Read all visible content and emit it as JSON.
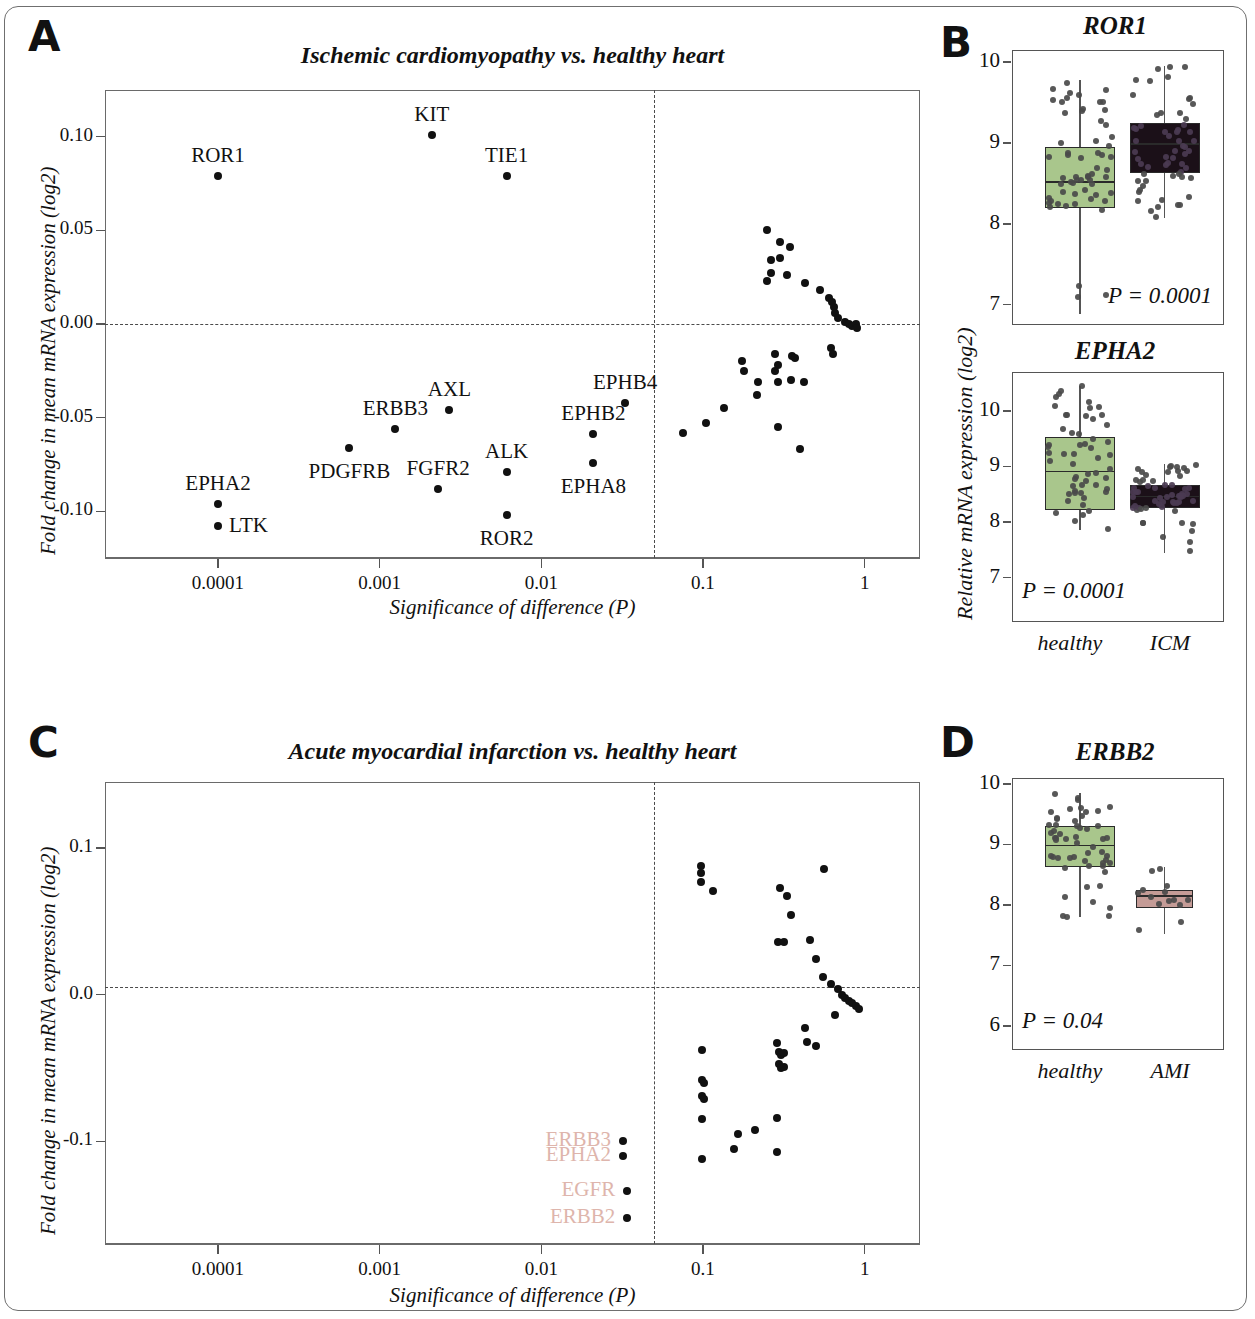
{
  "figure": {
    "panels": [
      "A",
      "B",
      "C",
      "D"
    ]
  },
  "panelA": {
    "letter": "A",
    "title": "Ischemic cardiomyopathy vs. healthy heart",
    "ylabel": "Fold change in mean mRNA expression (log2)",
    "xlabel": "Significance of difference (P)",
    "yticks": [
      "0.10",
      "0.05",
      "0.00",
      "-0.05",
      "-0.10"
    ],
    "xticks": [
      "0.0001",
      "0.001",
      "0.01",
      "0.1",
      "1"
    ]
  },
  "panelB": {
    "letter": "B",
    "ylabel": "Relative mRNA expression (log2)",
    "charts": [
      {
        "title": "ROR1",
        "yticks": [
          "10",
          "9",
          "8",
          "7"
        ],
        "pvalue": "P = 0.0001",
        "groups": [
          "healthy",
          "ICM"
        ]
      },
      {
        "title": "EPHA2",
        "yticks": [
          "10",
          "9",
          "8",
          "7"
        ],
        "pvalue": "P = 0.0001",
        "groups": [
          "healthy",
          "ICM"
        ]
      }
    ],
    "group_labels": [
      "healthy",
      "ICM"
    ]
  },
  "panelC": {
    "letter": "C",
    "title": "Acute myocardial infarction vs. healthy heart",
    "ylabel": "Fold change in mean mRNA expression (log2)",
    "xlabel": "Significance of difference (P)",
    "yticks": [
      "0.1",
      "0.0",
      "-0.1"
    ],
    "xticks": [
      "0.0001",
      "0.001",
      "0.01",
      "0.1",
      "1"
    ]
  },
  "panelD": {
    "letter": "D",
    "chart": {
      "title": "ERBB2",
      "yticks": [
        "10",
        "9",
        "8",
        "7",
        "6"
      ],
      "pvalue": "P = 0.04",
      "groups": [
        "healthy",
        "AMI"
      ]
    }
  },
  "colors": {
    "healthy_box": "#a9c68c",
    "icm_box": "#1b1018",
    "ami_box": "#c49b96",
    "pink_label": "#deb5ac",
    "dot": "#111111",
    "frame": "#6a6a6a"
  },
  "chart_data": [
    {
      "id": "panel-a",
      "type": "scatter",
      "title": "Ischemic cardiomyopathy vs. healthy heart",
      "xlabel": "Significance of difference (P)",
      "ylabel": "Fold change in mean mRNA expression (log2)",
      "xscale": "log",
      "xlim": [
        2e-05,
        2.2
      ],
      "ylim": [
        -0.125,
        0.125
      ],
      "xticks": [
        0.0001,
        0.001,
        0.01,
        0.1,
        1
      ],
      "yticks": [
        0.1,
        0.05,
        0.0,
        -0.05,
        -0.1
      ],
      "grid": false,
      "legend": "none",
      "annotations": {
        "vertical_dashed_line_at_p": 0.05,
        "horizontal_dashed_line_at_y": 0.0
      },
      "labeled_points": [
        {
          "label": "ROR1",
          "p": 0.0001,
          "fold": 0.079,
          "label_pos": "above"
        },
        {
          "label": "KIT",
          "p": 0.0021,
          "fold": 0.101,
          "label_pos": "above"
        },
        {
          "label": "TIE1",
          "p": 0.0061,
          "fold": 0.079,
          "label_pos": "above"
        },
        {
          "label": "EPHA2",
          "p": 0.0001,
          "fold": -0.096,
          "label_pos": "above"
        },
        {
          "label": "LTK",
          "p": 0.0001,
          "fold": -0.108,
          "label_pos": "right"
        },
        {
          "label": "PDGFRB",
          "p": 0.00065,
          "fold": -0.066,
          "label_pos": "below"
        },
        {
          "label": "ERBB3",
          "p": 0.00125,
          "fold": -0.056,
          "label_pos": "above"
        },
        {
          "label": "AXL",
          "p": 0.0027,
          "fold": -0.046,
          "label_pos": "above"
        },
        {
          "label": "FGFR2",
          "p": 0.0023,
          "fold": -0.088,
          "label_pos": "above"
        },
        {
          "label": "ALK",
          "p": 0.0061,
          "fold": -0.079,
          "label_pos": "above"
        },
        {
          "label": "ROR2",
          "p": 0.0061,
          "fold": -0.102,
          "label_pos": "below"
        },
        {
          "label": "EPHB2",
          "p": 0.021,
          "fold": -0.059,
          "label_pos": "above"
        },
        {
          "label": "EPHA8",
          "p": 0.021,
          "fold": -0.074,
          "label_pos": "below"
        },
        {
          "label": "EPHB4",
          "p": 0.033,
          "fold": -0.042,
          "label_pos": "above"
        }
      ],
      "unlabeled_points": [
        {
          "p": 0.25,
          "fold": 0.05
        },
        {
          "p": 0.3,
          "fold": 0.044
        },
        {
          "p": 0.345,
          "fold": 0.041
        },
        {
          "p": 0.265,
          "fold": 0.034
        },
        {
          "p": 0.3,
          "fold": 0.035
        },
        {
          "p": 0.265,
          "fold": 0.027
        },
        {
          "p": 0.25,
          "fold": 0.023
        },
        {
          "p": 0.33,
          "fold": 0.026
        },
        {
          "p": 0.43,
          "fold": 0.022
        },
        {
          "p": 0.53,
          "fold": 0.018
        },
        {
          "p": 0.6,
          "fold": 0.014
        },
        {
          "p": 0.63,
          "fold": 0.012
        },
        {
          "p": 0.65,
          "fold": 0.009
        },
        {
          "p": 0.66,
          "fold": 0.006
        },
        {
          "p": 0.68,
          "fold": 0.003
        },
        {
          "p": 0.76,
          "fold": 0.001
        },
        {
          "p": 0.8,
          "fold": 0.0
        },
        {
          "p": 0.84,
          "fold": -0.001
        },
        {
          "p": 0.88,
          "fold": 0.0
        },
        {
          "p": 0.9,
          "fold": -0.002
        },
        {
          "p": 0.62,
          "fold": -0.013
        },
        {
          "p": 0.64,
          "fold": -0.016
        },
        {
          "p": 0.28,
          "fold": -0.016
        },
        {
          "p": 0.29,
          "fold": -0.022
        },
        {
          "p": 0.355,
          "fold": -0.017
        },
        {
          "p": 0.37,
          "fold": -0.018
        },
        {
          "p": 0.28,
          "fold": -0.025
        },
        {
          "p": 0.175,
          "fold": -0.02
        },
        {
          "p": 0.18,
          "fold": -0.025
        },
        {
          "p": 0.22,
          "fold": -0.031
        },
        {
          "p": 0.29,
          "fold": -0.031
        },
        {
          "p": 0.35,
          "fold": -0.03
        },
        {
          "p": 0.42,
          "fold": -0.031
        },
        {
          "p": 0.215,
          "fold": -0.038
        },
        {
          "p": 0.29,
          "fold": -0.055
        },
        {
          "p": 0.135,
          "fold": -0.045
        },
        {
          "p": 0.105,
          "fold": -0.053
        },
        {
          "p": 0.075,
          "fold": -0.058
        },
        {
          "p": 0.4,
          "fold": -0.067
        }
      ]
    },
    {
      "id": "panel-c",
      "type": "scatter",
      "title": "Acute myocardial infarction vs. healthy heart",
      "xlabel": "Significance of difference (P)",
      "ylabel": "Fold change in mean mRNA expression (log2)",
      "xscale": "log",
      "xlim": [
        2e-05,
        2.2
      ],
      "ylim": [
        -0.17,
        0.145
      ],
      "xticks": [
        0.0001,
        0.001,
        0.01,
        0.1,
        1
      ],
      "yticks": [
        0.1,
        0.0,
        -0.1
      ],
      "grid": false,
      "legend": "none",
      "annotations": {
        "vertical_dashed_line_at_p": 0.05,
        "horizontal_dashed_line_at_y": 0.005
      },
      "labeled_points": [
        {
          "label": "ERBB3",
          "p": 0.032,
          "fold": -0.1,
          "label_pos": "left"
        },
        {
          "label": "EPHA2",
          "p": 0.032,
          "fold": -0.11,
          "label_pos": "left"
        },
        {
          "label": "EGFR",
          "p": 0.034,
          "fold": -0.134,
          "label_pos": "left"
        },
        {
          "label": "ERBB2",
          "p": 0.034,
          "fold": -0.152,
          "label_pos": "left"
        }
      ],
      "unlabeled_points": [
        {
          "p": 0.097,
          "fold": 0.088
        },
        {
          "p": 0.097,
          "fold": 0.083
        },
        {
          "p": 0.097,
          "fold": 0.077
        },
        {
          "p": 0.115,
          "fold": 0.071
        },
        {
          "p": 0.3,
          "fold": 0.073
        },
        {
          "p": 0.33,
          "fold": 0.067
        },
        {
          "p": 0.56,
          "fold": 0.086
        },
        {
          "p": 0.35,
          "fold": 0.054
        },
        {
          "p": 0.29,
          "fold": 0.036
        },
        {
          "p": 0.315,
          "fold": 0.036
        },
        {
          "p": 0.46,
          "fold": 0.037
        },
        {
          "p": 0.5,
          "fold": 0.024
        },
        {
          "p": 0.55,
          "fold": 0.012
        },
        {
          "p": 0.62,
          "fold": 0.007
        },
        {
          "p": 0.68,
          "fold": 0.004
        },
        {
          "p": 0.72,
          "fold": 0.0
        },
        {
          "p": 0.76,
          "fold": -0.002
        },
        {
          "p": 0.8,
          "fold": -0.004
        },
        {
          "p": 0.84,
          "fold": -0.006
        },
        {
          "p": 0.88,
          "fold": -0.008
        },
        {
          "p": 0.92,
          "fold": -0.01
        },
        {
          "p": 0.66,
          "fold": -0.014
        },
        {
          "p": 0.43,
          "fold": -0.023
        },
        {
          "p": 0.44,
          "fold": -0.032
        },
        {
          "p": 0.5,
          "fold": -0.035
        },
        {
          "p": 0.285,
          "fold": -0.033
        },
        {
          "p": 0.295,
          "fold": -0.039
        },
        {
          "p": 0.305,
          "fold": -0.041
        },
        {
          "p": 0.315,
          "fold": -0.04
        },
        {
          "p": 0.295,
          "fold": -0.047
        },
        {
          "p": 0.305,
          "fold": -0.05
        },
        {
          "p": 0.318,
          "fold": -0.049
        },
        {
          "p": 0.098,
          "fold": -0.038
        },
        {
          "p": 0.098,
          "fold": -0.058
        },
        {
          "p": 0.101,
          "fold": -0.06
        },
        {
          "p": 0.098,
          "fold": -0.069
        },
        {
          "p": 0.101,
          "fold": -0.071
        },
        {
          "p": 0.098,
          "fold": -0.085
        },
        {
          "p": 0.098,
          "fold": -0.112
        },
        {
          "p": 0.165,
          "fold": -0.095
        },
        {
          "p": 0.21,
          "fold": -0.092
        },
        {
          "p": 0.285,
          "fold": -0.084
        },
        {
          "p": 0.155,
          "fold": -0.105
        },
        {
          "p": 0.285,
          "fold": -0.107
        }
      ]
    },
    {
      "id": "panel-b-ror1",
      "type": "boxplot",
      "title": "ROR1",
      "ylabel": "Relative mRNA expression (log2)",
      "ylim": [
        6.75,
        10.15
      ],
      "yticks": [
        10,
        9,
        8,
        7
      ],
      "pvalue": "P = 0.0001",
      "boxes": [
        {
          "group": "healthy",
          "q1": 8.2,
          "median": 8.52,
          "q3": 8.95,
          "whisker_low": 6.88,
          "whisker_high": 9.78,
          "fill": "#a9c68c",
          "n": 60
        },
        {
          "group": "ICM",
          "q1": 8.63,
          "median": 8.99,
          "q3": 9.25,
          "whisker_low": 8.07,
          "whisker_high": 9.95,
          "fill": "#1b1018",
          "n": 60
        }
      ]
    },
    {
      "id": "panel-b-epha2",
      "type": "boxplot",
      "title": "EPHA2",
      "ylabel": "Relative mRNA expression (log2)",
      "ylim": [
        6.2,
        10.7
      ],
      "yticks": [
        10,
        9,
        8,
        7
      ],
      "pvalue": "P = 0.0001",
      "boxes": [
        {
          "group": "healthy",
          "q1": 8.22,
          "median": 8.91,
          "q3": 9.53,
          "whisker_low": 7.85,
          "whisker_high": 10.45,
          "fill": "#a9c68c",
          "n": 55
        },
        {
          "group": "ICM",
          "q1": 8.25,
          "median": 8.46,
          "q3": 8.67,
          "whisker_low": 7.45,
          "whisker_high": 9.05,
          "fill": "#1b1018",
          "n": 60
        }
      ]
    },
    {
      "id": "panel-d-erbb2",
      "type": "boxplot",
      "title": "ERBB2",
      "ylabel": "",
      "ylim": [
        5.6,
        10.1
      ],
      "yticks": [
        10,
        9,
        8,
        7,
        6
      ],
      "pvalue": "P = 0.04",
      "boxes": [
        {
          "group": "healthy",
          "q1": 8.62,
          "median": 8.98,
          "q3": 9.3,
          "whisker_low": 7.8,
          "whisker_high": 9.85,
          "fill": "#a9c68c",
          "n": 55
        },
        {
          "group": "AMI",
          "q1": 7.95,
          "median": 8.15,
          "q3": 8.25,
          "whisker_low": 7.52,
          "whisker_high": 8.62,
          "fill": "#c49b96",
          "n": 14
        }
      ]
    }
  ]
}
